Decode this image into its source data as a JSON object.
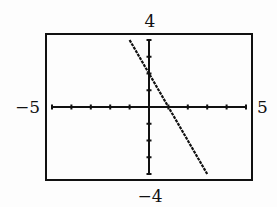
{
  "chart_data": {
    "type": "line",
    "title": "",
    "xlabel": "",
    "ylabel": "",
    "xlim": [
      -5,
      5
    ],
    "ylim": [
      -4,
      4
    ],
    "xscale": 1,
    "yscale": 1,
    "window_labels": {
      "xmin": "−5",
      "xmax": "5",
      "ymin": "−4",
      "ymax": "4"
    },
    "grid": false,
    "series": [
      {
        "name": "y = -2x + 2",
        "x": [
          -1,
          0,
          1,
          2,
          3
        ],
        "y": [
          4,
          2,
          0,
          -2,
          -4
        ]
      }
    ],
    "colors": {
      "ink": "#111111",
      "background": "#fdfdfd"
    }
  }
}
